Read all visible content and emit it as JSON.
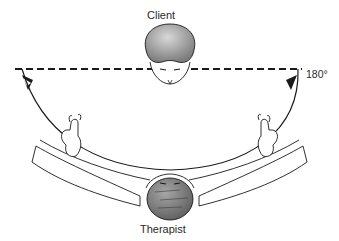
{
  "labels": {
    "client": "Client",
    "therapist": "Therapist",
    "angle": "180°"
  },
  "colors": {
    "line": "#1a1a1a",
    "head_fill": "#9a9a9a",
    "client_head_fill": "#a8a8a8",
    "skin_fill": "#ffffff"
  },
  "diagram": {
    "arrows": [
      "left-downward",
      "right-downward"
    ]
  }
}
